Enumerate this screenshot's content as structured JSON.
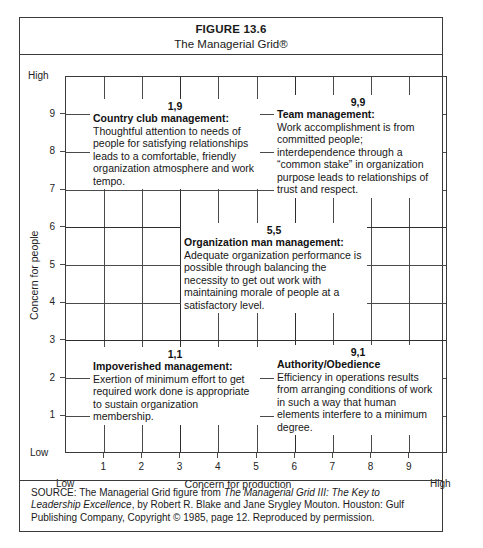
{
  "figure": {
    "number": "FIGURE 13.6",
    "title": "The Managerial Grid®"
  },
  "axes": {
    "y_title": "Concern for people",
    "y_high": "High",
    "y_low": "Low",
    "y_ticks": [
      "1",
      "2",
      "3",
      "4",
      "5",
      "6",
      "7",
      "8",
      "9"
    ],
    "x_title": "Concern for production",
    "x_low": "Low",
    "x_high": "High",
    "x_ticks": [
      "1",
      "2",
      "3",
      "4",
      "5",
      "6",
      "7",
      "8",
      "9"
    ]
  },
  "cells": [
    {
      "id": "country-club",
      "coord": "1,9",
      "heading": "Country club management:",
      "body": "Thoughtful attention to needs of people for satisfying relationships leads to a comfortable, friendly organization atmosphere and work tempo."
    },
    {
      "id": "team",
      "coord": "9,9",
      "heading": "Team management:",
      "body": "Work accomplishment is from committed people; interdependence through a “common stake” in organization purpose leads to relationships of trust and respect."
    },
    {
      "id": "organization-man",
      "coord": "5,5",
      "heading": "Organization man management:",
      "body": "Adequate organization performance is possible through balancing the necessity to get out work with maintaining morale of people at a satisfactory level."
    },
    {
      "id": "impoverished",
      "coord": "1,1",
      "heading": "Impoverished management:",
      "body": "Exertion of minimum effort to get required work done is appropriate to sustain organization membership."
    },
    {
      "id": "authority-obedience",
      "coord": "9,1",
      "heading": "Authority/Obedience",
      "body": "Efficiency in operations results from arranging conditions of work in such a way that human elements interfere to a minimum degree."
    }
  ],
  "source": {
    "label": "SOURCE:",
    "part1": " The Managerial Grid figure from ",
    "italic1": "The Managerial Grid III: The Key to Leadership Excellence",
    "part2": ", by Robert R. Blake and Jane Srygley Mouton. Houston: Gulf Publishing Company, Copyright © 1985, page 12. Reproduced by permission."
  },
  "chart_data": {
    "type": "scatter",
    "title": "The Managerial Grid®",
    "xlabel": "Concern for production",
    "ylabel": "Concern for people",
    "xlim": [
      0,
      10
    ],
    "ylim": [
      0,
      10
    ],
    "xticks": [
      1,
      2,
      3,
      4,
      5,
      6,
      7,
      8,
      9
    ],
    "yticks": [
      1,
      2,
      3,
      4,
      5,
      6,
      7,
      8,
      9
    ],
    "grid": true,
    "legend": "none",
    "points": [
      {
        "label": "Country club management",
        "x": 1,
        "y": 9
      },
      {
        "label": "Team management",
        "x": 9,
        "y": 9
      },
      {
        "label": "Organization man management",
        "x": 5,
        "y": 5
      },
      {
        "label": "Impoverished management",
        "x": 1,
        "y": 1
      },
      {
        "label": "Authority/Obedience",
        "x": 9,
        "y": 1
      }
    ]
  }
}
